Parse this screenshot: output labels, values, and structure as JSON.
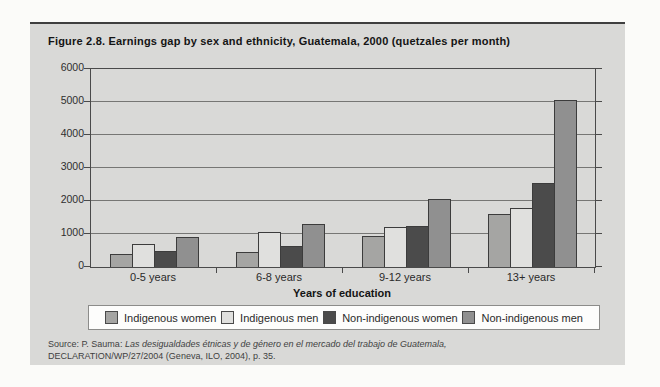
{
  "figure": {
    "title": "Figure 2.8.  Earnings gap by sex and ethnicity, Guatemala, 2000 (quetzales per month)",
    "source_prefix": "Source: P. Sauma: ",
    "source_italic": "Las desigualdades étnicas y de género en el mercado del trabajo de Guatemala,",
    "source_line2": "DECLARATION/WP/27/2004 (Geneva, ILO, 2004), p. 35."
  },
  "chart_data": {
    "type": "bar",
    "title": "Figure 2.8. Earnings gap by sex and ethnicity, Guatemala, 2000 (quetzales per month)",
    "categories": [
      "0-5 years",
      "6-8 years",
      "9-12 years",
      "13+ years"
    ],
    "series": [
      {
        "name": "Indigenous women",
        "color": "#a5a5a3",
        "values": [
          400,
          450,
          950,
          1600
        ]
      },
      {
        "name": "Indigenous men",
        "color": "#e0e0de",
        "values": [
          700,
          1050,
          1200,
          1800
        ]
      },
      {
        "name": "Non-indigenous women",
        "color": "#4b4b4b",
        "values": [
          500,
          650,
          1250,
          2550
        ]
      },
      {
        "name": "Non-indigenous men",
        "color": "#909090",
        "values": [
          900,
          1300,
          2050,
          5050
        ]
      }
    ],
    "xlabel": "Years of education",
    "ylabel": "",
    "ylim": [
      0,
      6000
    ],
    "ytick_interval": 1000,
    "grid": "horizontal",
    "legend_position": "bottom",
    "bar_border_color": "#3c3c3c",
    "plot_background": "#d9d9d7",
    "gridline_color": "#767674"
  }
}
